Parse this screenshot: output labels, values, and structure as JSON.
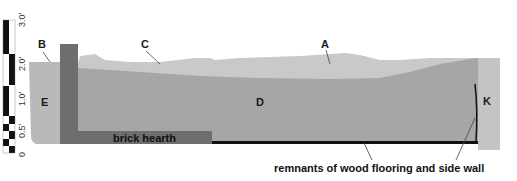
{
  "diagram": {
    "type": "stratigraphic-profile",
    "colors": {
      "top_layer": "#c9c9c9",
      "layer_d": "#a6a6a6",
      "layer_e": "#b9b9b9",
      "layer_k": "#c4c4c4",
      "chimney": "#6e6e6e",
      "hearth": "#6e6e6e",
      "floor_line": "#111111",
      "scale_black": "#111111"
    },
    "scale": {
      "ticks": [
        "0",
        "0.5'",
        "1.0'",
        "2.0'",
        "3.0'"
      ]
    },
    "layers": {
      "A": "A",
      "B": "B",
      "C": "C",
      "D": "D",
      "E": "E",
      "K": "K"
    },
    "features": {
      "hearth_label": "brick hearth",
      "floor_label": "remnants of wood flooring and side wall"
    }
  }
}
